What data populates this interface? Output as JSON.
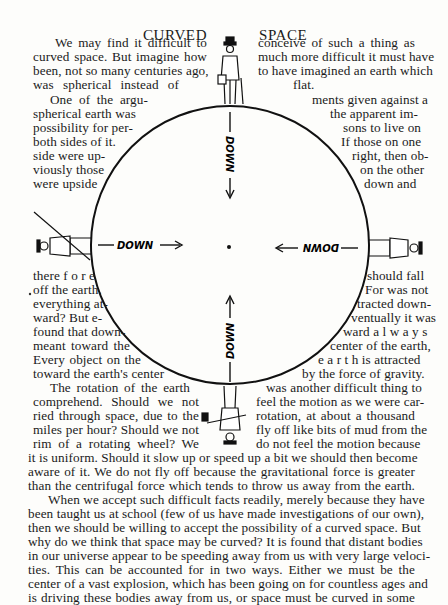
{
  "header": {
    "left": "CURVED",
    "right": "SPACE"
  },
  "figure": {
    "labels": {
      "top": "DOWN",
      "bottom": "DOWN",
      "left": "DOWN",
      "right": "DOWN"
    },
    "figures": [
      "man-standing-top",
      "man-upside-down-bottom",
      "man-left-side",
      "man-right-side"
    ]
  },
  "lines": [
    {
      "x": 55,
      "y": 47,
      "w": 152,
      "text": "We may find it difficult to"
    },
    {
      "x": 33,
      "y": 61,
      "w": 174,
      "text": "curved space.  But imagine how"
    },
    {
      "x": 33,
      "y": 75,
      "w": 174,
      "text": "been, not so many centuries ago,"
    },
    {
      "x": 33,
      "y": 89,
      "w": 146,
      "text": "was  spherical  instead  of"
    },
    {
      "x": 258,
      "y": 47,
      "w": 157,
      "text": "conceive  of  such  a  thing  as"
    },
    {
      "x": 258,
      "y": 61,
      "w": 157,
      "text": "much more difficult it must have"
    },
    {
      "x": 258,
      "y": 75,
      "w": 157,
      "text": "to have imagined an earth which"
    },
    {
      "x": 293,
      "y": 89,
      "w": 30,
      "text": "flat."
    },
    {
      "x": 50,
      "y": 104,
      "w": 98,
      "text": "One of the argu-"
    },
    {
      "x": 33,
      "y": 118,
      "w": 98,
      "text": "spherical earth was"
    },
    {
      "x": 33,
      "y": 132,
      "w": 86,
      "text": "possibility for per-"
    },
    {
      "x": 33,
      "y": 146,
      "w": 80,
      "text": "both sides of it."
    },
    {
      "x": 33,
      "y": 160,
      "w": 72,
      "text": "side were up-"
    },
    {
      "x": 33,
      "y": 174,
      "w": 66,
      "text": "viously those"
    },
    {
      "x": 33,
      "y": 188,
      "w": 61,
      "text": "were upside"
    },
    {
      "x": 312,
      "y": 104,
      "w": 103,
      "text": "ments given against a"
    },
    {
      "x": 330,
      "y": 118,
      "w": 85,
      "text": "the apparent im-"
    },
    {
      "x": 343,
      "y": 132,
      "w": 72,
      "text": "sons to live on"
    },
    {
      "x": 341,
      "y": 146,
      "w": 74,
      "text": "If those on one"
    },
    {
      "x": 352,
      "y": 160,
      "w": 63,
      "text": "right, then ob-"
    },
    {
      "x": 360,
      "y": 174,
      "w": 55,
      "text": "on the other"
    },
    {
      "x": 364,
      "y": 188,
      "w": 51,
      "text": "down  and"
    },
    {
      "x": 33,
      "y": 280,
      "w": 57,
      "text": "there f o r e"
    },
    {
      "x": 33,
      "y": 294,
      "w": 65,
      "text": "off the earth."
    },
    {
      "x": 33,
      "y": 308,
      "w": 69,
      "text": "everything at-"
    },
    {
      "x": 33,
      "y": 322,
      "w": 68,
      "text": "ward?  But e-"
    },
    {
      "x": 33,
      "y": 336,
      "w": 80,
      "text": "found that down-"
    },
    {
      "x": 33,
      "y": 350,
      "w": 97,
      "text": "meant toward the"
    },
    {
      "x": 33,
      "y": 364,
      "w": 108,
      "text": "Every object on the"
    },
    {
      "x": 33,
      "y": 378,
      "w": 115,
      "text": "toward the earth's center"
    },
    {
      "x": 367,
      "y": 280,
      "w": 48,
      "text": "should fall"
    },
    {
      "x": 365,
      "y": 294,
      "w": 50,
      "text": "For was not"
    },
    {
      "x": 357,
      "y": 308,
      "w": 58,
      "text": "tracted down-"
    },
    {
      "x": 351,
      "y": 322,
      "w": 64,
      "text": "ventually it was"
    },
    {
      "x": 343,
      "y": 336,
      "w": 72,
      "text": "ward  a l w a y s"
    },
    {
      "x": 330,
      "y": 350,
      "w": 85,
      "text": "center of the earth,"
    },
    {
      "x": 318,
      "y": 364,
      "w": 97,
      "text": "e a r t h  is  attracted"
    },
    {
      "x": 302,
      "y": 378,
      "w": 113,
      "text": "by the force of gravity."
    },
    {
      "x": 50,
      "y": 392,
      "w": 140,
      "text": "The rotation of the earth"
    },
    {
      "x": 33,
      "y": 406,
      "w": 166,
      "text": "comprehend.   Should  we  not"
    },
    {
      "x": 33,
      "y": 420,
      "w": 166,
      "text": "ried  through  space,  due  to  the"
    },
    {
      "x": 33,
      "y": 434,
      "w": 166,
      "text": "miles per hour?  Should we not"
    },
    {
      "x": 33,
      "y": 448,
      "w": 166,
      "text": "rim  of  a  rotating  wheel?   We"
    },
    {
      "x": 266,
      "y": 392,
      "w": 149,
      "text": "was another difficult thing to"
    },
    {
      "x": 256,
      "y": 406,
      "w": 159,
      "text": "feel the motion as we were car-"
    },
    {
      "x": 256,
      "y": 420,
      "w": 159,
      "text": "rotation,  at  about  a  thousand"
    },
    {
      "x": 256,
      "y": 434,
      "w": 159,
      "text": "fly off like bits of mud from the"
    },
    {
      "x": 256,
      "y": 448,
      "w": 159,
      "text": "do  not  feel  the  motion  because"
    },
    {
      "x": 28,
      "y": 462,
      "w": 387,
      "text": "it is uniform.   Should it slow up or speed up a bit we should then become"
    },
    {
      "x": 28,
      "y": 476,
      "w": 387,
      "text": "aware of it.   We do not fly off because the gravitational force is greater"
    },
    {
      "x": 28,
      "y": 490,
      "w": 387,
      "text": "than the centrifugal force which tends to throw us away from the earth."
    },
    {
      "x": 48,
      "y": 504,
      "w": 367,
      "text": "When we accept such difficult facts readily, merely because they have"
    },
    {
      "x": 28,
      "y": 518,
      "w": 387,
      "text": "been taught us at school (few of us have made investigations of our own),"
    },
    {
      "x": 28,
      "y": 532,
      "w": 387,
      "text": "then we should be willing to accept the possibility of a curved space.  But"
    },
    {
      "x": 28,
      "y": 546,
      "w": 387,
      "text": "why do we think that space may be curved?  It is found that distant bodies"
    },
    {
      "x": 28,
      "y": 560,
      "w": 387,
      "text": "in our universe appear to be speeding away from us with very large veloci-"
    },
    {
      "x": 28,
      "y": 574,
      "w": 387,
      "text": "ties.   This can be accounted for in two ways.   Either we must be the"
    },
    {
      "x": 28,
      "y": 588,
      "w": 387,
      "text": "center of a vast explosion, which has been going on for countless ages and"
    },
    {
      "x": 28,
      "y": 602,
      "w": 387,
      "text": "is driving these bodies away from us, or space must be curved in some"
    }
  ]
}
